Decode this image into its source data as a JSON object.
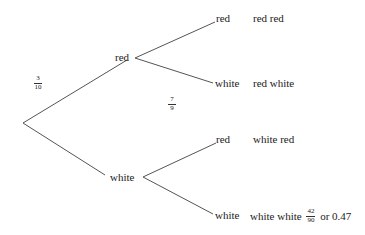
{
  "diagram": {
    "type": "probability-tree",
    "first_level": [
      {
        "label": "red",
        "probability": {
          "num": "3",
          "den": "10"
        }
      },
      {
        "label": "white"
      }
    ],
    "second_level": {
      "red": [
        {
          "label": "red",
          "outcome": "red red"
        },
        {
          "label": "white",
          "outcome": "red white",
          "probability": {
            "num": "7",
            "den": "9"
          }
        }
      ],
      "white": [
        {
          "label": "red",
          "outcome": "white red"
        },
        {
          "label": "white",
          "outcome": "white white",
          "result": {
            "num": "42",
            "den": "90"
          },
          "result_suffix": "or 0.47"
        }
      ]
    },
    "line_color": "#555555"
  }
}
